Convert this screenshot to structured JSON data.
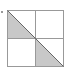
{
  "diagram": {
    "type": "grid-2x2-with-shaded-triangles",
    "grid": {
      "rows": 2,
      "cols": 2,
      "x": 7,
      "y": 10,
      "size": 56
    },
    "colors": {
      "line": "#999999",
      "fill": "#c8c8c8",
      "background": "#ffffff",
      "marker": "#777777"
    },
    "shaded_regions": [
      {
        "cell": "top-left",
        "shape": "triangle",
        "half": "lower-left"
      },
      {
        "cell": "bottom-right",
        "shape": "triangle",
        "half": "lower-left"
      }
    ],
    "diagonal": "top-left-to-bottom-right",
    "marker": {
      "x": 2,
      "y": 12,
      "label": "."
    }
  }
}
